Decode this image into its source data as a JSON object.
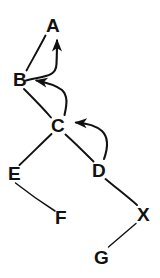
{
  "diagram": {
    "type": "tree-graph",
    "background_color": "#ffffff",
    "stroke_color": "#111111",
    "nodes": [
      {
        "id": "A",
        "label": "A",
        "x": 46,
        "y": 16
      },
      {
        "id": "B",
        "label": "B",
        "x": 13,
        "y": 70
      },
      {
        "id": "C",
        "label": "C",
        "x": 51,
        "y": 116
      },
      {
        "id": "D",
        "label": "D",
        "x": 92,
        "y": 161
      },
      {
        "id": "E",
        "label": "E",
        "x": 8,
        "y": 164
      },
      {
        "id": "F",
        "label": "F",
        "x": 55,
        "y": 208
      },
      {
        "id": "X",
        "label": "X",
        "x": 137,
        "y": 205
      },
      {
        "id": "G",
        "label": "G",
        "x": 94,
        "y": 248
      }
    ],
    "edges": [
      {
        "from": "B",
        "to": "A",
        "kind": "line",
        "arrow": false
      },
      {
        "from": "B",
        "to": "C",
        "kind": "line",
        "arrow": false
      },
      {
        "from": "C",
        "to": "E",
        "kind": "line",
        "arrow": false
      },
      {
        "from": "C",
        "to": "D",
        "kind": "line",
        "arrow": false
      },
      {
        "from": "E",
        "to": "F",
        "kind": "line",
        "arrow": false
      },
      {
        "from": "D",
        "to": "X",
        "kind": "line",
        "arrow": false
      },
      {
        "from": "X",
        "to": "G",
        "kind": "line",
        "arrow": false
      }
    ],
    "arrows": [
      {
        "from": "B",
        "to": "A",
        "kind": "curve",
        "arrow": true
      },
      {
        "from": "C",
        "to": "B",
        "kind": "curve",
        "arrow": true
      },
      {
        "from": "D",
        "to": "C",
        "kind": "curve",
        "arrow": true
      }
    ]
  }
}
